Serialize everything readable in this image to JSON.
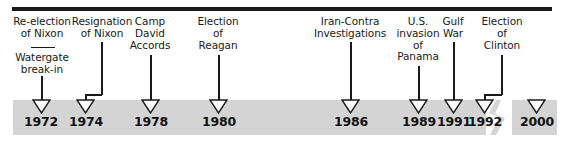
{
  "figure": {
    "kind": "historical-timeline",
    "colors": {
      "band": "#d4d4d4",
      "rule": "#1a1a1a",
      "text": "#1a1a1a",
      "arrow_fill": "#ffffff",
      "arrow_stroke": "#1a1a1a",
      "background": "#ffffff"
    },
    "axis_break": {
      "present": true,
      "between": [
        "1992",
        "2000"
      ],
      "shape": "zigzag"
    }
  },
  "events": [
    {
      "id": "watergate",
      "label": "Watergate\nbreak-in",
      "year": "1972",
      "leader": "straight",
      "has_divider_above": true
    },
    {
      "id": "reelection-nixon",
      "label": "Re-election\nof Nixon",
      "year": "1972",
      "leader": "none",
      "stacked_above": "watergate"
    },
    {
      "id": "resignation-nixon",
      "label": "Resignation\nof Nixon",
      "year": "1974",
      "leader": "elbow"
    },
    {
      "id": "camp-david",
      "label": "Camp\nDavid\nAccords",
      "year": "1978",
      "leader": "straight"
    },
    {
      "id": "election-reagan",
      "label": "Election\nof\nReagan",
      "year": "1980",
      "leader": "straight"
    },
    {
      "id": "iran-contra",
      "label": "Iran-Contra\nInvestigations",
      "year": "1986",
      "leader": "straight"
    },
    {
      "id": "panama-invasion",
      "label": "U.S.\ninvasion\nof\nPanama",
      "year": "1989",
      "leader": "straight"
    },
    {
      "id": "gulf-war",
      "label": "Gulf\nWar",
      "year": "1991",
      "leader": "straight"
    },
    {
      "id": "election-clinton",
      "label": "Election\nof\nClinton",
      "year": "1992",
      "leader": "elbow"
    }
  ],
  "years": [
    {
      "value": "1972"
    },
    {
      "value": "1974"
    },
    {
      "value": "1978"
    },
    {
      "value": "1980"
    },
    {
      "value": "1986"
    },
    {
      "value": "1989"
    },
    {
      "value": "1991"
    },
    {
      "value": "1992"
    },
    {
      "value": "2000"
    }
  ]
}
